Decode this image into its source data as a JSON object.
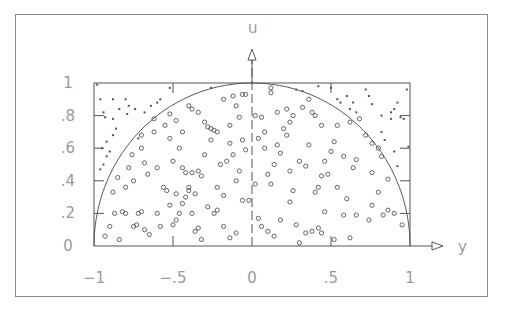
{
  "chart_data": {
    "type": "scatter",
    "title": "",
    "xlabel": "y",
    "ylabel": "u",
    "xlim": [
      -1,
      1
    ],
    "ylim": [
      0,
      1
    ],
    "x_ticks": [
      -1,
      -0.5,
      0,
      0.5,
      1
    ],
    "x_tick_labels": [
      "−1",
      "−.5",
      "0",
      ".5",
      "1"
    ],
    "y_ticks": [
      0,
      0.2,
      0.4,
      0.6,
      0.8,
      1
    ],
    "y_tick_labels": [
      "0",
      ".2",
      ".4",
      ".6",
      ".8",
      "1"
    ],
    "grid": false,
    "legend": null,
    "curve": {
      "name": "semicircle",
      "equation": "u = sqrt(1 - y^2)"
    },
    "series": [
      {
        "name": "inside (accepted)",
        "marker": "circle",
        "points": [
          [
            -0.93,
            0.06
          ],
          [
            -0.9,
            0.12
          ],
          [
            -0.87,
            0.2
          ],
          [
            -0.84,
            0.04
          ],
          [
            -0.82,
            0.21
          ],
          [
            -0.8,
            0.2
          ],
          [
            -0.75,
            0.12
          ],
          [
            -0.72,
            0.2
          ],
          [
            -0.73,
            0.13
          ],
          [
            -0.7,
            0.21
          ],
          [
            -0.68,
            0.1
          ],
          [
            -0.65,
            0.07
          ],
          [
            -0.6,
            0.2
          ],
          [
            -0.58,
            0.12
          ],
          [
            -0.52,
            0.25
          ],
          [
            -0.5,
            0.13
          ],
          [
            -0.48,
            0.16
          ],
          [
            -0.46,
            0.2
          ],
          [
            -0.44,
            0.26
          ],
          [
            -0.42,
            0.3
          ],
          [
            -0.4,
            0.34
          ],
          [
            -0.38,
            0.2
          ],
          [
            -0.36,
            0.09
          ],
          [
            -0.34,
            0.11
          ],
          [
            -0.32,
            0.04
          ],
          [
            -0.28,
            0.24
          ],
          [
            -0.24,
            0.2
          ],
          [
            -0.22,
            0.22
          ],
          [
            -0.18,
            0.12
          ],
          [
            -0.14,
            0.05
          ],
          [
            -0.1,
            0.08
          ],
          [
            -0.06,
            0.28
          ],
          [
            -0.02,
            0.28
          ],
          [
            0.04,
            0.17
          ],
          [
            0.06,
            0.12
          ],
          [
            0.1,
            0.09
          ],
          [
            0.14,
            0.06
          ],
          [
            0.18,
            0.16
          ],
          [
            0.24,
            0.27
          ],
          [
            0.28,
            0.13
          ],
          [
            0.3,
            0.02
          ],
          [
            0.34,
            0.08
          ],
          [
            0.38,
            0.09
          ],
          [
            0.42,
            0.11
          ],
          [
            0.44,
            0.08
          ],
          [
            0.46,
            0.21
          ],
          [
            0.52,
            0.04
          ],
          [
            0.58,
            0.19
          ],
          [
            0.62,
            0.05
          ],
          [
            0.66,
            0.19
          ],
          [
            0.74,
            0.16
          ],
          [
            0.76,
            0.25
          ],
          [
            0.8,
            0.33
          ],
          [
            0.83,
            0.19
          ],
          [
            0.86,
            0.22
          ],
          [
            0.9,
            0.2
          ],
          [
            0.95,
            0.13
          ],
          [
            -0.88,
            0.33
          ],
          [
            -0.85,
            0.42
          ],
          [
            -0.8,
            0.36
          ],
          [
            -0.78,
            0.48
          ],
          [
            -0.75,
            0.4
          ],
          [
            -0.76,
            0.56
          ],
          [
            -0.7,
            0.6
          ],
          [
            -0.68,
            0.51
          ],
          [
            -0.66,
            0.44
          ],
          [
            -0.62,
            0.7
          ],
          [
            -0.6,
            0.48
          ],
          [
            -0.56,
            0.36
          ],
          [
            -0.54,
            0.34
          ],
          [
            -0.52,
            0.66
          ],
          [
            -0.5,
            0.52
          ],
          [
            -0.48,
            0.32
          ],
          [
            -0.46,
            0.6
          ],
          [
            -0.44,
            0.48
          ],
          [
            -0.42,
            0.45
          ],
          [
            -0.4,
            0.36
          ],
          [
            -0.38,
            0.45
          ],
          [
            -0.36,
            0.32
          ],
          [
            -0.34,
            0.46
          ],
          [
            -0.32,
            0.43
          ],
          [
            -0.3,
            0.56
          ],
          [
            -0.28,
            0.73
          ],
          [
            -0.26,
            0.65
          ],
          [
            -0.24,
            0.71
          ],
          [
            -0.22,
            0.36
          ],
          [
            -0.2,
            0.5
          ],
          [
            -0.18,
            0.31
          ],
          [
            -0.16,
            0.52
          ],
          [
            -0.14,
            0.63
          ],
          [
            -0.12,
            0.56
          ],
          [
            -0.1,
            0.4
          ],
          [
            -0.08,
            0.46
          ],
          [
            -0.06,
            0.65
          ],
          [
            -0.04,
            0.59
          ],
          [
            0.02,
            0.38
          ],
          [
            0.04,
            0.66
          ],
          [
            0.08,
            0.6
          ],
          [
            0.1,
            0.44
          ],
          [
            0.12,
            0.38
          ],
          [
            0.14,
            0.5
          ],
          [
            0.16,
            0.62
          ],
          [
            0.18,
            0.57
          ],
          [
            0.2,
            0.72
          ],
          [
            0.22,
            0.68
          ],
          [
            0.24,
            0.46
          ],
          [
            0.26,
            0.34
          ],
          [
            0.3,
            0.52
          ],
          [
            0.34,
            0.49
          ],
          [
            0.36,
            0.62
          ],
          [
            0.4,
            0.33
          ],
          [
            0.42,
            0.36
          ],
          [
            0.44,
            0.43
          ],
          [
            0.46,
            0.52
          ],
          [
            0.48,
            0.44
          ],
          [
            0.5,
            0.58
          ],
          [
            0.52,
            0.64
          ],
          [
            0.54,
            0.36
          ],
          [
            0.58,
            0.55
          ],
          [
            0.6,
            0.29
          ],
          [
            0.64,
            0.48
          ],
          [
            0.66,
            0.53
          ],
          [
            0.72,
            0.68
          ],
          [
            0.76,
            0.45
          ],
          [
            0.8,
            0.6
          ],
          [
            0.82,
            0.55
          ],
          [
            0.86,
            0.41
          ],
          [
            -0.7,
            0.68
          ],
          [
            -0.62,
            0.78
          ],
          [
            -0.55,
            0.74
          ],
          [
            -0.52,
            0.81
          ],
          [
            -0.48,
            0.77
          ],
          [
            -0.44,
            0.7
          ],
          [
            -0.4,
            0.86
          ],
          [
            -0.38,
            0.84
          ],
          [
            -0.34,
            0.82
          ],
          [
            -0.3,
            0.76
          ],
          [
            -0.26,
            0.72
          ],
          [
            -0.22,
            0.7
          ],
          [
            -0.18,
            0.9
          ],
          [
            -0.14,
            0.74
          ],
          [
            -0.12,
            0.92
          ],
          [
            -0.1,
            0.86
          ],
          [
            -0.08,
            0.79
          ],
          [
            -0.06,
            0.93
          ],
          [
            -0.04,
            0.93
          ],
          [
            0.02,
            0.8
          ],
          [
            0.06,
            0.79
          ],
          [
            0.08,
            0.7
          ],
          [
            0.12,
            0.97
          ],
          [
            0.12,
            0.94
          ],
          [
            0.16,
            0.82
          ],
          [
            0.22,
            0.84
          ],
          [
            0.24,
            0.76
          ],
          [
            0.26,
            0.8
          ],
          [
            0.32,
            0.85
          ],
          [
            0.36,
            0.9
          ],
          [
            0.38,
            0.82
          ],
          [
            0.4,
            0.8
          ],
          [
            0.44,
            0.74
          ],
          [
            0.54,
            0.74
          ],
          [
            0.62,
            0.76
          ],
          [
            0.68,
            0.78
          ],
          [
            0.76,
            0.63
          ]
        ]
      },
      {
        "name": "outside (rejected)",
        "marker": "dot",
        "points": [
          [
            -0.98,
            0.99
          ],
          [
            -0.96,
            0.9
          ],
          [
            -0.94,
            0.82
          ],
          [
            -0.93,
            0.79
          ],
          [
            -0.88,
            0.9
          ],
          [
            -0.88,
            0.78
          ],
          [
            -0.86,
            0.72
          ],
          [
            -0.84,
            0.84
          ],
          [
            -0.8,
            0.9
          ],
          [
            -0.79,
            0.81
          ],
          [
            -0.78,
            0.86
          ],
          [
            -0.94,
            0.5
          ],
          [
            -0.95,
            0.6
          ],
          [
            -0.92,
            0.55
          ],
          [
            -0.9,
            0.58
          ],
          [
            -0.92,
            0.64
          ],
          [
            -0.96,
            0.47
          ],
          [
            -0.88,
            0.68
          ],
          [
            -0.74,
            0.84
          ],
          [
            -0.72,
            0.66
          ],
          [
            -0.68,
            0.82
          ],
          [
            -0.64,
            0.86
          ],
          [
            -0.6,
            0.88
          ],
          [
            -0.58,
            0.9
          ],
          [
            -0.52,
            0.97
          ],
          [
            -0.26,
            0.97
          ],
          [
            0.28,
            0.96
          ],
          [
            0.32,
            0.95
          ],
          [
            0.42,
            0.98
          ],
          [
            0.5,
            0.97
          ],
          [
            0.54,
            0.9
          ],
          [
            0.56,
            0.88
          ],
          [
            0.6,
            0.92
          ],
          [
            0.62,
            0.84
          ],
          [
            0.64,
            0.88
          ],
          [
            0.66,
            0.82
          ],
          [
            0.72,
            0.96
          ],
          [
            0.74,
            0.92
          ],
          [
            0.76,
            0.87
          ],
          [
            0.82,
            0.7
          ],
          [
            0.84,
            0.65
          ],
          [
            0.88,
            0.78
          ],
          [
            0.9,
            0.84
          ],
          [
            0.92,
            0.88
          ],
          [
            0.94,
            0.79
          ],
          [
            0.96,
            0.78
          ],
          [
            0.98,
            0.96
          ],
          [
            0.99,
            0.61
          ],
          [
            0.9,
            0.58
          ],
          [
            0.92,
            0.49
          ],
          [
            0.88,
            0.82
          ],
          [
            0.82,
            0.8
          ]
        ]
      }
    ]
  },
  "axes": {
    "x_label": "y",
    "y_label": "u"
  }
}
